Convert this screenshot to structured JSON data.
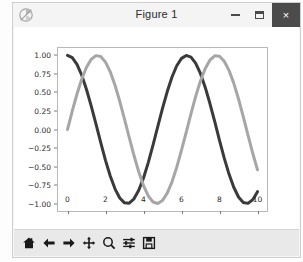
{
  "window": {
    "title": "Figure 1",
    "icon": "matplotlib-icon",
    "controls": {
      "minimize": "–",
      "maximize": "❑",
      "close": "×"
    }
  },
  "toolbar": {
    "buttons": [
      {
        "name": "home-icon",
        "tooltip": "Reset original view"
      },
      {
        "name": "arrow-left-icon",
        "tooltip": "Back to previous view"
      },
      {
        "name": "arrow-right-icon",
        "tooltip": "Forward to next view"
      },
      {
        "name": "move-cross-icon",
        "tooltip": "Pan axes with left mouse, zoom with right"
      },
      {
        "name": "magnifier-icon",
        "tooltip": "Zoom to rectangle"
      },
      {
        "name": "configure-subplots-icon",
        "tooltip": "Configure subplots"
      },
      {
        "name": "save-floppy-icon",
        "tooltip": "Save the figure"
      }
    ]
  },
  "chart_data": {
    "type": "line",
    "title": "",
    "xlabel": "",
    "ylabel": "",
    "xlim": [
      -0.5,
      10.5
    ],
    "ylim": [
      -1.1,
      1.1
    ],
    "grid": false,
    "legend": null,
    "xticks": [
      "0",
      "2",
      "4",
      "6",
      "8",
      "10"
    ],
    "xtick_values": [
      0,
      2,
      4,
      6,
      8,
      10
    ],
    "yticks": [
      "1.00",
      "0.75",
      "0.50",
      "0.25",
      "0.00",
      "−0.25",
      "−0.50",
      "−0.75",
      "−1.00"
    ],
    "ytick_values": [
      1.0,
      0.75,
      0.5,
      0.25,
      0.0,
      -0.25,
      -0.5,
      -0.75,
      -1.0
    ],
    "series": [
      {
        "name": "cos(x)",
        "color": "#3a3a3a",
        "linewidth": 3,
        "x": [
          0.0,
          0.25,
          0.5,
          0.75,
          1.0,
          1.25,
          1.5,
          1.75,
          2.0,
          2.25,
          2.5,
          2.75,
          3.0,
          3.25,
          3.5,
          3.75,
          4.0,
          4.25,
          4.5,
          4.75,
          5.0,
          5.25,
          5.5,
          5.75,
          6.0,
          6.25,
          6.5,
          6.75,
          7.0,
          7.25,
          7.5,
          7.75,
          8.0,
          8.25,
          8.5,
          8.75,
          9.0,
          9.25,
          9.5,
          9.75,
          10.0
        ],
        "values": [
          1.0,
          0.969,
          0.878,
          0.732,
          0.54,
          0.315,
          0.071,
          -0.178,
          -0.416,
          -0.628,
          -0.801,
          -0.924,
          -0.99,
          -0.994,
          -0.936,
          -0.82,
          -0.654,
          -0.447,
          -0.211,
          0.038,
          0.284,
          0.512,
          0.709,
          0.861,
          0.96,
          1.0,
          0.977,
          0.893,
          0.754,
          0.568,
          0.347,
          0.105,
          -0.146,
          -0.387,
          -0.602,
          -0.779,
          -0.911,
          -0.985,
          -0.997,
          -0.947,
          -0.839
        ]
      },
      {
        "name": "sin(x)",
        "color": "#a6a6a6",
        "linewidth": 3,
        "x": [
          0.0,
          0.25,
          0.5,
          0.75,
          1.0,
          1.25,
          1.5,
          1.75,
          2.0,
          2.25,
          2.5,
          2.75,
          3.0,
          3.25,
          3.5,
          3.75,
          4.0,
          4.25,
          4.5,
          4.75,
          5.0,
          5.25,
          5.5,
          5.75,
          6.0,
          6.25,
          6.5,
          6.75,
          7.0,
          7.25,
          7.5,
          7.75,
          8.0,
          8.25,
          8.5,
          8.75,
          9.0,
          9.25,
          9.5,
          9.75,
          10.0
        ],
        "values": [
          0.0,
          0.247,
          0.479,
          0.682,
          0.841,
          0.949,
          0.997,
          0.984,
          0.909,
          0.778,
          0.598,
          0.381,
          0.141,
          -0.108,
          -0.351,
          -0.572,
          -0.757,
          -0.895,
          -0.978,
          -0.999,
          -0.959,
          -0.859,
          -0.706,
          -0.509,
          -0.279,
          -0.034,
          0.215,
          0.451,
          0.657,
          0.823,
          0.938,
          0.994,
          0.989,
          0.922,
          0.798,
          0.626,
          0.412,
          0.174,
          -0.075,
          -0.321,
          -0.544
        ]
      }
    ]
  }
}
